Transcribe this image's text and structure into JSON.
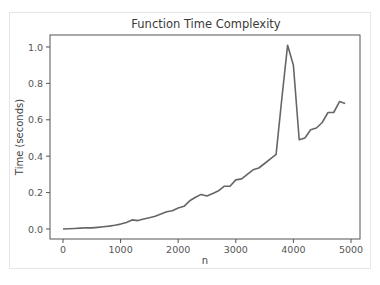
{
  "chart_data": {
    "type": "line",
    "title": "Function Time Complexity",
    "xlabel": "n",
    "ylabel": "Time (seconds)",
    "xlim": [
      -250,
      5150
    ],
    "ylim": [
      -0.05,
      1.07
    ],
    "xticks": [
      0,
      1000,
      2000,
      3000,
      4000,
      5000
    ],
    "xtick_labels": [
      "0",
      "1000",
      "2000",
      "3000",
      "4000",
      "5000"
    ],
    "yticks": [
      0.0,
      0.2,
      0.4,
      0.6,
      0.8,
      1.0
    ],
    "ytick_labels": [
      "0.0",
      "0.2",
      "0.4",
      "0.6",
      "0.8",
      "1.0"
    ],
    "grid": false,
    "legend": null,
    "line_color": "#666666",
    "series": [
      {
        "name": "time",
        "x": [
          0,
          100,
          200,
          300,
          400,
          500,
          600,
          700,
          800,
          900,
          1000,
          1100,
          1200,
          1300,
          1400,
          1500,
          1600,
          1700,
          1800,
          1900,
          2000,
          2100,
          2200,
          2300,
          2400,
          2500,
          2600,
          2700,
          2800,
          2900,
          3000,
          3100,
          3200,
          3300,
          3400,
          3500,
          3600,
          3700,
          3800,
          3900,
          4000,
          4100,
          4200,
          4300,
          4400,
          4500,
          4600,
          4700,
          4800,
          4900
        ],
        "values": [
          0.0,
          0.001,
          0.003,
          0.005,
          0.007,
          0.006,
          0.009,
          0.012,
          0.016,
          0.021,
          0.027,
          0.036,
          0.05,
          0.046,
          0.055,
          0.062,
          0.07,
          0.082,
          0.095,
          0.1,
          0.115,
          0.125,
          0.155,
          0.175,
          0.19,
          0.182,
          0.195,
          0.21,
          0.235,
          0.235,
          0.27,
          0.275,
          0.3,
          0.325,
          0.335,
          0.36,
          0.385,
          0.41,
          0.72,
          1.01,
          0.9,
          0.49,
          0.5,
          0.545,
          0.555,
          0.585,
          0.64,
          0.64,
          0.7,
          0.69
        ]
      }
    ]
  }
}
